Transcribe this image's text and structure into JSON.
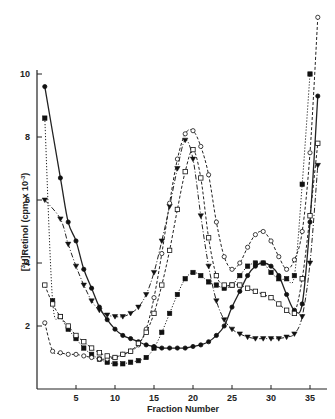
{
  "chart_data": {
    "type": "line",
    "title": "",
    "xlabel": "Fraction Number",
    "ylabel": "[3H]Retinol (cpm x 10^-3)",
    "ylabel_display": {
      "bracket": "3H",
      "rest": "Retinol (cpm x 10",
      "exp": "-3",
      "close": ")"
    },
    "xlim": [
      0,
      37
    ],
    "ylim": [
      0,
      10
    ],
    "xticks": [
      5,
      10,
      15,
      20,
      25,
      30,
      35
    ],
    "yticks": [
      2,
      4,
      6,
      8,
      10
    ],
    "grid": false,
    "legend": "none",
    "series": [
      {
        "name": "filled-circle",
        "marker": "circle-filled",
        "line": "solid",
        "x": [
          1,
          3,
          4,
          5,
          6,
          7,
          8,
          9,
          10,
          11,
          12,
          13,
          14,
          15,
          16,
          17,
          18,
          19,
          20,
          21,
          22,
          23,
          24,
          25,
          26,
          27,
          28,
          29,
          30,
          31,
          32,
          33,
          34,
          35,
          36
        ],
        "y": [
          9.6,
          6.7,
          5.3,
          4.7,
          3.8,
          3.2,
          2.6,
          2.2,
          1.9,
          1.7,
          1.6,
          1.5,
          1.4,
          1.35,
          1.3,
          1.3,
          1.3,
          1.3,
          1.35,
          1.4,
          1.5,
          1.7,
          2.0,
          2.6,
          3.1,
          3.6,
          3.9,
          4.0,
          3.9,
          3.6,
          3.0,
          2.5,
          2.7,
          5.3,
          9.3
        ]
      },
      {
        "name": "filled-square",
        "marker": "square-filled",
        "line": "dotted",
        "x": [
          1,
          2,
          3,
          4,
          5,
          6,
          7,
          8,
          9,
          10,
          11,
          12,
          13,
          14,
          15,
          16,
          17,
          18,
          19,
          20,
          21,
          22,
          23,
          24,
          25,
          26,
          27,
          28,
          29,
          30,
          31,
          32,
          33,
          34,
          35
        ],
        "y": [
          8.6,
          2.8,
          2.3,
          1.9,
          1.6,
          1.3,
          1.1,
          0.95,
          0.85,
          0.8,
          0.8,
          0.85,
          0.9,
          1.0,
          1.3,
          1.8,
          2.4,
          3.0,
          3.5,
          3.7,
          3.6,
          3.4,
          3.3,
          3.2,
          3.3,
          3.6,
          3.9,
          4.0,
          4.0,
          3.7,
          3.5,
          3.5,
          3.6,
          6.5,
          10.0
        ]
      },
      {
        "name": "filled-triangle",
        "marker": "triangle-down-filled",
        "line": "dash-dot",
        "x": [
          1,
          3,
          4,
          5,
          6,
          7,
          8,
          9,
          10,
          11,
          12,
          13,
          14,
          15,
          16,
          17,
          18,
          19,
          20,
          21,
          22,
          23,
          24,
          25,
          26,
          27,
          28,
          29,
          30,
          31,
          32,
          33,
          34,
          35,
          36
        ],
        "y": [
          6.0,
          5.4,
          4.6,
          3.9,
          3.3,
          2.8,
          2.5,
          2.35,
          2.3,
          2.3,
          2.4,
          2.6,
          3.0,
          3.7,
          4.7,
          5.8,
          7.0,
          7.9,
          7.3,
          5.5,
          3.9,
          2.8,
          2.2,
          1.9,
          1.75,
          1.65,
          1.6,
          1.6,
          1.6,
          1.6,
          1.65,
          1.75,
          2.3,
          4.0,
          7.1
        ]
      },
      {
        "name": "open-circle",
        "marker": "circle-open",
        "line": "dashed",
        "x": [
          1,
          2,
          3,
          4,
          5,
          6,
          7,
          8,
          9,
          10,
          11,
          12,
          13,
          14,
          15,
          16,
          17,
          18,
          19,
          20,
          21,
          22,
          23,
          24,
          25,
          26,
          27,
          28,
          29,
          30,
          31,
          32,
          33,
          34,
          35,
          36
        ],
        "y": [
          2.1,
          1.2,
          1.15,
          1.1,
          1.1,
          1.05,
          1.0,
          0.95,
          0.95,
          1.0,
          1.1,
          1.2,
          1.4,
          1.9,
          2.9,
          4.3,
          5.9,
          7.3,
          8.1,
          8.2,
          7.7,
          6.8,
          5.3,
          4.2,
          3.8,
          4.0,
          4.5,
          4.9,
          5.0,
          4.7,
          4.2,
          3.8,
          4.1,
          5.0,
          7.5,
          11.8
        ]
      },
      {
        "name": "open-square",
        "marker": "square-open",
        "line": "dashed",
        "x": [
          1,
          2,
          3,
          4,
          5,
          6,
          7,
          8,
          9,
          10,
          11,
          12,
          13,
          14,
          15,
          16,
          17,
          18,
          19,
          20,
          21,
          22,
          23,
          24,
          25,
          26,
          27,
          28,
          29,
          30,
          31,
          32,
          33,
          34,
          35,
          36
        ],
        "y": [
          3.3,
          2.7,
          2.3,
          2.0,
          1.7,
          1.5,
          1.3,
          1.15,
          1.05,
          1.0,
          1.1,
          1.2,
          1.45,
          1.8,
          2.4,
          3.3,
          4.4,
          5.7,
          6.9,
          7.6,
          6.7,
          4.8,
          3.6,
          3.3,
          3.3,
          3.3,
          3.2,
          3.1,
          3.0,
          2.9,
          2.7,
          2.5,
          2.4,
          3.5,
          5.5,
          7.8
        ]
      }
    ]
  }
}
